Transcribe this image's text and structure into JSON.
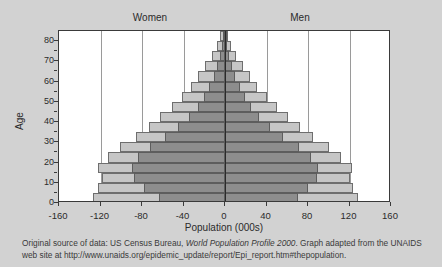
{
  "figure": {
    "left_label": "Women",
    "right_label": "Men",
    "caption_part1": "Original source of data: US Census Bureau, ",
    "caption_italic": "World Population Profile 2000",
    "caption_part2": ". Graph adapted from the UNAIDS web site at http://www.unaids.org/epidemic_update/report/Epi_report.htm#thepopulation."
  },
  "colors": {
    "background": "#d2d2d2",
    "plot_background": "#ffffff",
    "light_series": "#c6c6c6",
    "dark_series": "#8d8d8d",
    "axis": "#3a3a3a",
    "gridline": "#9a9a9a"
  },
  "chart_data": {
    "type": "bar",
    "subtype": "population-pyramid",
    "title": "",
    "xlabel": "Population (000s)",
    "ylabel": "Age",
    "xlim": [
      -160,
      160
    ],
    "ylim": [
      0,
      85
    ],
    "xticks": [
      -160,
      -120,
      -80,
      -40,
      0,
      40,
      80,
      120,
      160
    ],
    "xticklabels": [
      "-160",
      "-120",
      "-80",
      "-40",
      "0",
      "40",
      "80",
      "120",
      "160"
    ],
    "yticks": [
      0,
      10,
      20,
      30,
      40,
      50,
      60,
      70,
      80
    ],
    "yticklabels": [
      "0",
      "10",
      "20",
      "30",
      "40",
      "50",
      "60",
      "70",
      "80"
    ],
    "grid": "vertical",
    "legend_position": "none",
    "annotations": [
      "Women",
      "Men"
    ],
    "age_bands": [
      "0-4",
      "5-9",
      "10-14",
      "15-19",
      "20-24",
      "25-29",
      "30-34",
      "35-39",
      "40-44",
      "45-49",
      "50-54",
      "55-59",
      "60-64",
      "65-69",
      "70-74",
      "75-79",
      "80+"
    ],
    "series": [
      {
        "name": "Projected population without AIDS",
        "color": "#c6c6c6",
        "women": [
          127,
          122,
          119,
          122,
          113,
          101,
          86,
          73,
          63,
          51,
          41,
          33,
          26,
          19,
          13,
          8,
          5
        ],
        "men": [
          128,
          123,
          120,
          122,
          112,
          100,
          85,
          72,
          61,
          50,
          40,
          31,
          24,
          17,
          11,
          6,
          3
        ]
      },
      {
        "name": "Population with AIDS mortality",
        "color": "#8d8d8d",
        "women": [
          64,
          78,
          88,
          90,
          84,
          72,
          58,
          45,
          35,
          26,
          20,
          15,
          11,
          8,
          5,
          3,
          2
        ],
        "men": [
          70,
          80,
          89,
          90,
          83,
          71,
          56,
          43,
          33,
          25,
          19,
          14,
          10,
          7,
          4,
          2,
          1
        ]
      }
    ]
  }
}
